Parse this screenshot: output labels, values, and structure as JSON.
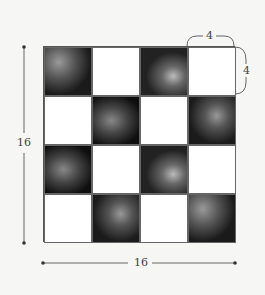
{
  "diagram": {
    "type": "checkerboard-quilt",
    "rows": 4,
    "cols": 4,
    "cells": [
      [
        "photo",
        "white",
        "photo",
        "white"
      ],
      [
        "white",
        "photo",
        "white",
        "photo"
      ],
      [
        "photo",
        "white",
        "photo",
        "white"
      ],
      [
        "white",
        "photo",
        "white",
        "photo"
      ]
    ],
    "dimensions": {
      "height_label": "16",
      "width_label": "16",
      "block_width_label": "4",
      "block_height_label": "4"
    },
    "colors": {
      "background": "#f6f6f4",
      "line": "#555555",
      "white_block": "#ffffff"
    }
  }
}
